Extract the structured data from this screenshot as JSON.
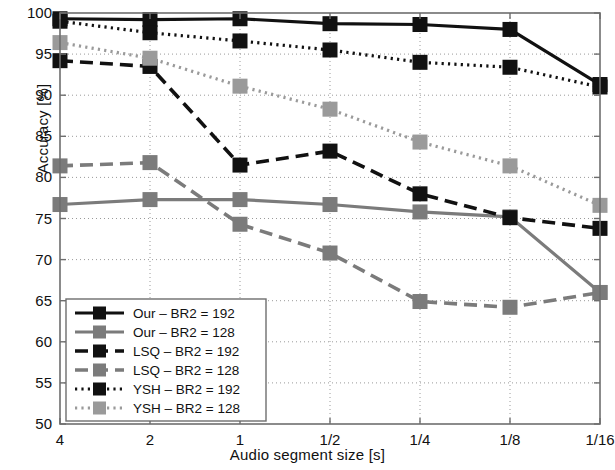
{
  "chart_data": {
    "type": "line",
    "title": "",
    "xlabel": "Audio segment size [s]",
    "ylabel": "Accuracy [%]",
    "categories": [
      "4",
      "2",
      "1",
      "1/2",
      "1/4",
      "1/8",
      "1/16"
    ],
    "ylim": [
      50,
      100
    ],
    "yticks": [
      50,
      55,
      60,
      65,
      70,
      75,
      80,
      85,
      90,
      95,
      100
    ],
    "grid": true,
    "legend_position": "lower-left",
    "series": [
      {
        "name": "Our – BR2 = 192",
        "color": "#111111",
        "style": "solid",
        "marker": "square",
        "values": [
          99.3,
          99.2,
          99.3,
          98.7,
          98.6,
          98.0,
          91.3
        ]
      },
      {
        "name": "Our – BR2 = 128",
        "color": "#7b7b7b",
        "style": "solid",
        "marker": "square",
        "values": [
          76.7,
          77.3,
          77.3,
          76.7,
          75.8,
          75.2,
          66.0
        ]
      },
      {
        "name": "LSQ – BR2 = 192",
        "color": "#111111",
        "style": "dashed",
        "marker": "square",
        "values": [
          94.2,
          93.5,
          81.5,
          83.2,
          78.0,
          75.1,
          73.8
        ]
      },
      {
        "name": "LSQ – BR2 = 128",
        "color": "#7b7b7b",
        "style": "dashed",
        "marker": "square",
        "values": [
          81.4,
          81.8,
          74.3,
          70.8,
          64.9,
          64.2,
          66.0
        ]
      },
      {
        "name": "YSH – BR2 = 192",
        "color": "#111111",
        "style": "dotted",
        "marker": "square",
        "values": [
          99.0,
          97.6,
          96.6,
          95.5,
          94.0,
          93.4,
          91.0
        ]
      },
      {
        "name": "YSH – BR2 = 128",
        "color": "#9a9a9a",
        "style": "dotted",
        "marker": "square",
        "values": [
          96.4,
          94.5,
          91.1,
          88.3,
          84.3,
          81.4,
          76.6
        ]
      }
    ]
  },
  "axes": {
    "xlabel": "Audio segment size [s]",
    "ylabel": "Accuracy [%]"
  }
}
